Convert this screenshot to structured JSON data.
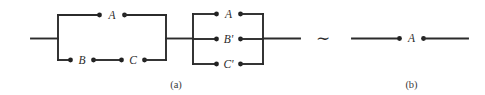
{
  "figure": {
    "kind": "switching-network-equivalence-diagram",
    "background_color": "#ffffff",
    "wire_color": "#2b2b2b",
    "node_color": "#222222",
    "label_color": "#2b2b2b",
    "equivalence_symbol": "∼"
  },
  "panel_a": {
    "caption": "(a)",
    "networks": [
      {
        "name": "series-parallel-network-1",
        "branches": [
          {
            "name": "branch-top",
            "contacts": [
              "A"
            ]
          },
          {
            "name": "branch-bottom",
            "contacts": [
              "B",
              "C"
            ]
          }
        ]
      },
      {
        "name": "parallel-network-2",
        "branches": [
          {
            "name": "branch-top",
            "contacts": [
              "A"
            ]
          },
          {
            "name": "branch-middle",
            "contacts": [
              "B'"
            ]
          },
          {
            "name": "branch-bottom",
            "contacts": [
              "C'"
            ]
          }
        ]
      }
    ],
    "labels": {
      "n1_top": "A",
      "n1_bottom_left": "B",
      "n1_bottom_right": "C",
      "n2_top": "A",
      "n2_middle": "B'",
      "n2_bottom": "C'"
    }
  },
  "panel_b": {
    "caption": "(b)",
    "networks": [
      {
        "name": "single-contact-network",
        "branches": [
          {
            "name": "branch-single",
            "contacts": [
              "A"
            ]
          }
        ]
      }
    ],
    "labels": {
      "contact": "A"
    }
  }
}
